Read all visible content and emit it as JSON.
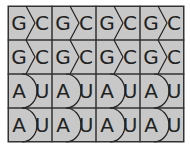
{
  "figure": {
    "grid": {
      "rows": 4,
      "cols": 4
    },
    "colors": {
      "tile": "#c8c8c8",
      "stroke": "#222222",
      "grid_line": "#333333"
    },
    "rows": [
      {
        "type": "chevron",
        "pairs": [
          {
            "left": "G",
            "right": "C"
          },
          {
            "left": "G",
            "right": "C"
          },
          {
            "left": "G",
            "right": "C"
          },
          {
            "left": "G",
            "right": "C"
          }
        ]
      },
      {
        "type": "chevron",
        "pairs": [
          {
            "left": "G",
            "right": "C"
          },
          {
            "left": "G",
            "right": "C"
          },
          {
            "left": "G",
            "right": "C"
          },
          {
            "left": "G",
            "right": "C"
          }
        ]
      },
      {
        "type": "curve",
        "pairs": [
          {
            "left": "A",
            "right": "U"
          },
          {
            "left": "A",
            "right": "U"
          },
          {
            "left": "A",
            "right": "U"
          },
          {
            "left": "A",
            "right": "U"
          }
        ]
      },
      {
        "type": "curve",
        "pairs": [
          {
            "left": "A",
            "right": "U"
          },
          {
            "left": "A",
            "right": "U"
          },
          {
            "left": "A",
            "right": "U"
          },
          {
            "left": "A",
            "right": "U"
          }
        ]
      }
    ]
  }
}
